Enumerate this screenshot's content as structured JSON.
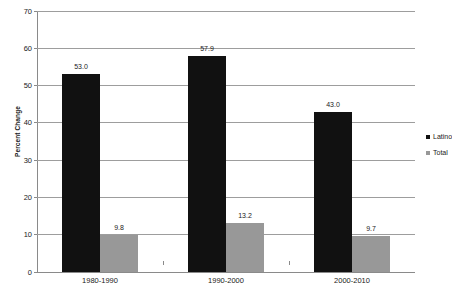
{
  "chart_data": {
    "type": "bar",
    "title": "",
    "xlabel": "",
    "ylabel": "Percent Change",
    "ylim": [
      0,
      70
    ],
    "yticks": [
      0,
      10,
      20,
      30,
      40,
      50,
      60,
      70
    ],
    "ytick_labels": [
      "0",
      "10",
      "20",
      "30",
      "40",
      "50",
      "60",
      "70"
    ],
    "grid": true,
    "legend_position": "right",
    "categories": [
      "1980-1990",
      "1990-2000",
      "2000-2010"
    ],
    "series": [
      {
        "name": "Latino",
        "color": "#111111",
        "values": [
          53.0,
          57.9,
          43.0
        ],
        "labels": [
          "53.0",
          "57.9",
          "43.0"
        ]
      },
      {
        "name": "Total",
        "color": "#989898",
        "values": [
          9.8,
          13.2,
          9.7
        ],
        "labels": [
          "9.8",
          "13.2",
          "9.7"
        ]
      }
    ]
  },
  "legend": {
    "items": [
      {
        "label": "Latino",
        "swatch": "legend-swatch-black"
      },
      {
        "label": "Total",
        "swatch": "legend-swatch-gray"
      }
    ]
  }
}
